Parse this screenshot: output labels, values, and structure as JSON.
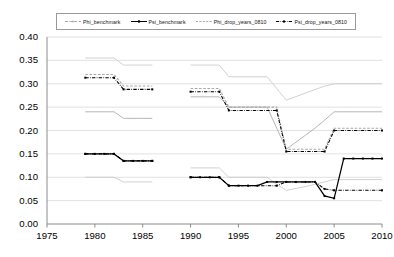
{
  "chart_data": {
    "type": "line",
    "title": "",
    "xlabel": "",
    "ylabel": "",
    "xlim": [
      1975,
      2010
    ],
    "ylim": [
      0.0,
      0.4
    ],
    "xticks": [
      "1975",
      "1980",
      "1985",
      "1990",
      "1995",
      "2000",
      "2005",
      "2010"
    ],
    "yticks": [
      "0.00",
      "0.05",
      "0.10",
      "0.15",
      "0.20",
      "0.25",
      "0.30",
      "0.35",
      "0.40"
    ],
    "grid": true,
    "legend_position": "top",
    "legend": [
      "Phi_benchmark",
      "Psi_benchmark",
      "Phi_drop_years_0810",
      "Psi_drop_years_0810"
    ],
    "colors": {
      "phi_benchmark": "#a8a8a8",
      "psi_benchmark": "#000000",
      "phi_drop": "#a8a8a8",
      "psi_drop": "#000000",
      "grid": "#d9d9d9",
      "axis": "#808080"
    },
    "series": [
      {
        "name": "Phi_benchmark",
        "style": "solid",
        "color": "#a8a8a8",
        "segments": [
          {
            "x": [
              1979,
              1980,
              1981,
              1982,
              1983,
              1984,
              1985,
              1986
            ],
            "y": [
              0.24,
              0.24,
              0.24,
              0.24,
              0.226,
              0.226,
              0.226,
              0.226
            ]
          },
          {
            "x": [
              1990,
              1991,
              1992,
              1993,
              1994,
              1995,
              1996,
              1997,
              1998,
              1999,
              2000,
              2001,
              2002,
              2003,
              2004,
              2005,
              2006,
              2007,
              2008,
              2009,
              2010
            ],
            "y": [
              0.272,
              0.272,
              0.272,
              0.272,
              0.25,
              0.25,
              0.25,
              0.25,
              0.25,
              0.205,
              0.16,
              0.175,
              0.19,
              0.205,
              0.222,
              0.24,
              0.24,
              0.24,
              0.24,
              0.24,
              0.24
            ]
          }
        ]
      },
      {
        "name": "Phi_benchmark_upper_band",
        "style": "solid",
        "color": "#c9c9c9",
        "segments": [
          {
            "x": [
              1979,
              1982,
              1983,
              1986
            ],
            "y": [
              0.355,
              0.355,
              0.34,
              0.34
            ]
          },
          {
            "x": [
              1990,
              1993,
              1994,
              1998,
              1999,
              2000,
              2002,
              2004,
              2005,
              2010
            ],
            "y": [
              0.34,
              0.34,
              0.315,
              0.315,
              0.29,
              0.265,
              0.28,
              0.295,
              0.3,
              0.3
            ]
          }
        ]
      },
      {
        "name": "Phi_benchmark_lower_band",
        "style": "solid",
        "color": "#c9c9c9",
        "segments": [
          {
            "x": [
              1979,
              1982,
              1983,
              1986
            ],
            "y": [
              0.1,
              0.1,
              0.09,
              0.09
            ]
          },
          {
            "x": [
              1990,
              1993,
              1994,
              1998,
              1999,
              2000,
              2002,
              2004,
              2005,
              2010
            ],
            "y": [
              0.12,
              0.12,
              0.1,
              0.1,
              0.085,
              0.072,
              0.08,
              0.09,
              0.095,
              0.095
            ]
          }
        ]
      },
      {
        "name": "Psi_benchmark",
        "style": "solid-markers",
        "color": "#000000",
        "segments": [
          {
            "x": [
              1979,
              1980,
              1981,
              1982,
              1983,
              1984,
              1985,
              1986
            ],
            "y": [
              0.15,
              0.15,
              0.15,
              0.15,
              0.135,
              0.135,
              0.135,
              0.135
            ]
          },
          {
            "x": [
              1990,
              1991,
              1992,
              1993,
              1994,
              1995,
              1996,
              1997,
              1998,
              1999,
              2000,
              2001,
              2002,
              2003,
              2004,
              2005,
              2006,
              2007,
              2008,
              2009,
              2010
            ],
            "y": [
              0.1,
              0.1,
              0.1,
              0.1,
              0.082,
              0.082,
              0.082,
              0.082,
              0.09,
              0.09,
              0.09,
              0.09,
              0.09,
              0.09,
              0.06,
              0.055,
              0.14,
              0.14,
              0.14,
              0.14,
              0.14
            ]
          }
        ]
      },
      {
        "name": "Phi_drop_years_0810",
        "style": "dashed",
        "color": "#a8a8a8",
        "segments": [
          {
            "x": [
              1979,
              1982,
              1983,
              1986
            ],
            "y": [
              0.32,
              0.32,
              0.295,
              0.295
            ]
          },
          {
            "x": [
              1990,
              1993,
              1994,
              1999,
              2000,
              2004,
              2005,
              2010
            ],
            "y": [
              0.29,
              0.29,
              0.25,
              0.25,
              0.16,
              0.16,
              0.205,
              0.205
            ]
          }
        ]
      },
      {
        "name": "Psi_drop_years_0810",
        "style": "dash-dot-markers",
        "color": "#000000",
        "segments": [
          {
            "x": [
              1979,
              1982,
              1983,
              1986
            ],
            "y": [
              0.313,
              0.313,
              0.288,
              0.288
            ]
          },
          {
            "x": [
              1979,
              1982,
              1983,
              1986
            ],
            "y": [
              0.15,
              0.15,
              0.135,
              0.135
            ]
          },
          {
            "x": [
              1990,
              1993,
              1994,
              1999,
              2000,
              2004,
              2005,
              2010
            ],
            "y": [
              0.283,
              0.283,
              0.243,
              0.243,
              0.155,
              0.155,
              0.2,
              0.2
            ]
          },
          {
            "x": [
              1990,
              1993,
              1994,
              1999,
              2000,
              2003,
              2004,
              2005,
              2010
            ],
            "y": [
              0.1,
              0.1,
              0.082,
              0.082,
              0.09,
              0.09,
              0.075,
              0.072,
              0.072
            ]
          }
        ]
      }
    ]
  }
}
